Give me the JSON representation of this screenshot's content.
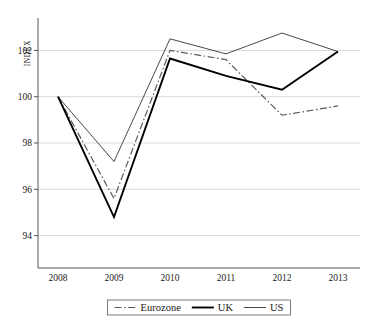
{
  "chart_data": {
    "type": "line",
    "title": "",
    "xlabel": "",
    "ylabel": "INDEX",
    "categories": [
      "2008",
      "2009",
      "2010",
      "2011",
      "2012",
      "2013"
    ],
    "x": [
      2008,
      2009,
      2010,
      2011,
      2012,
      2013
    ],
    "ylim": [
      92.6,
      103.4
    ],
    "yticks": [
      94,
      96,
      98,
      100,
      102
    ],
    "ytick_labels": [
      "94",
      "96",
      "98",
      "100",
      "102"
    ],
    "grid": true,
    "legend_position": "bottom",
    "series": [
      {
        "name": "Eurozone",
        "style": "dash-dot",
        "color": "#5a5a5a",
        "values": [
          100.0,
          95.6,
          102.0,
          101.6,
          99.2,
          99.6
        ]
      },
      {
        "name": "UK",
        "style": "solid-thick",
        "color": "#000000",
        "values": [
          100.0,
          94.8,
          101.65,
          100.9,
          100.3,
          101.95
        ]
      },
      {
        "name": "US",
        "style": "solid-thin",
        "color": "#4a4a4a",
        "values": [
          100.0,
          97.2,
          102.5,
          101.85,
          102.75,
          101.95
        ]
      }
    ]
  },
  "axis": {
    "y_title": "INDEX"
  },
  "legend": {
    "items": [
      {
        "label": "Eurozone",
        "key": "eurozone"
      },
      {
        "label": "UK",
        "key": "uk"
      },
      {
        "label": "US",
        "key": "us"
      }
    ]
  }
}
